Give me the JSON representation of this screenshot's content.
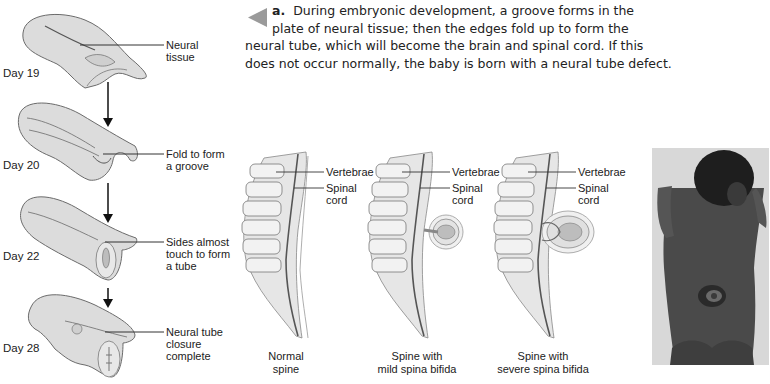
{
  "caption": {
    "marker": "a.",
    "text_line1": "During embryonic development, a groove forms in the",
    "text_line2": "plate of neural tissue; then the edges fold up to form the",
    "text_line3": "neural tube, which will become the brain and spinal cord. If this",
    "text_line4": "does not occur normally, the baby is born with a neural tube defect."
  },
  "stages": [
    {
      "day": "Day 19",
      "label_line1": "Neural",
      "label_line2": "tissue",
      "label_line3": ""
    },
    {
      "day": "Day 20",
      "label_line1": "Fold to form",
      "label_line2": "a groove",
      "label_line3": ""
    },
    {
      "day": "Day 22",
      "label_line1": "Sides almost",
      "label_line2": "touch to form",
      "label_line3": "a tube"
    },
    {
      "day": "Day 28",
      "label_line1": "Neural tube",
      "label_line2": "closure",
      "label_line3": "complete"
    }
  ],
  "spines": [
    {
      "vertebrae_label": "Vertebrae",
      "cord_label_line1": "Spinal",
      "cord_label_line2": "cord",
      "caption_line1": "Normal",
      "caption_line2": "spine"
    },
    {
      "vertebrae_label": "Vertebrae",
      "cord_label_line1": "Spinal",
      "cord_label_line2": "cord",
      "caption_line1": "Spine with",
      "caption_line2": "mild spina bifida"
    },
    {
      "vertebrae_label": "Vertebrae",
      "cord_label_line1": "Spinal",
      "cord_label_line2": "cord",
      "caption_line1": "Spine with",
      "caption_line2": "severe spina bifida"
    }
  ],
  "photo": {
    "subject": "infant with spina bifida lesion on lower back"
  },
  "colors": {
    "marker": "#9a9a9a",
    "tissue_fill": "#d9d9d9",
    "tissue_stroke": "#6b6b6b",
    "background": "#ffffff"
  }
}
